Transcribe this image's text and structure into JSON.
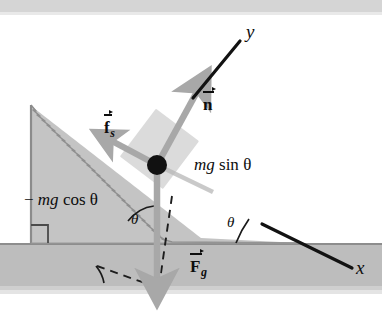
{
  "figure": {
    "background_color": "#ffffff",
    "width": 382,
    "height": 311
  },
  "colors": {
    "incline_fill": "#c4c4c4",
    "incline_edge": "#8f8f8f",
    "ground_fill": "#bdbdbd",
    "block_fill": "#d8d8d8",
    "vector_gray": "#a8a8a8",
    "axis_black": "#121212",
    "dot_black": "#111111",
    "top_strip": "#d5d5d5"
  },
  "axes": {
    "y_label": "y",
    "x_label": "x"
  },
  "vectors": [
    {
      "name": "normal-force",
      "label": "n",
      "has_arrow_accent": true,
      "subscript": "",
      "color": "#a8a8a8",
      "direction": "up-right perpendicular to incline"
    },
    {
      "name": "static-friction",
      "label": "f",
      "has_arrow_accent": true,
      "subscript": "s",
      "color": "#a8a8a8",
      "direction": "up-left along incline"
    },
    {
      "name": "gravity-force",
      "label": "F",
      "has_arrow_accent": true,
      "subscript": "g",
      "color": "#a8a8a8",
      "direction": "straight down"
    }
  ],
  "components": {
    "parallel": {
      "text_italic": "mg",
      "text_upright": " sin ",
      "symbol": "θ",
      "full": "mg sin θ"
    },
    "perpendicular": {
      "minus": "−",
      "text_italic": "mg",
      "text_upright": " cos ",
      "symbol": "θ",
      "full": "− mg cos θ"
    }
  },
  "angles": [
    {
      "name": "angle-at-particle",
      "label": "θ"
    },
    {
      "name": "angle-at-incline-base",
      "label": "θ"
    }
  ],
  "markers": {
    "right_angle": "right-angle-square",
    "particle": "point-mass-dot"
  }
}
